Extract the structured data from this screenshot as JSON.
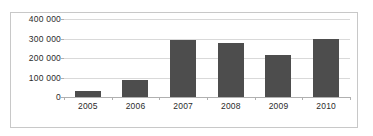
{
  "chart_data": {
    "type": "bar",
    "title": "",
    "subtitle": "",
    "xlabel": "",
    "ylabel": "",
    "categories": [
      "2005",
      "2006",
      "2007",
      "2008",
      "2009",
      "2010"
    ],
    "values": [
      30000,
      88000,
      292000,
      275000,
      218000,
      300000
    ],
    "series": [
      {
        "name": "",
        "values": [
          30000,
          88000,
          292000,
          275000,
          218000,
          300000
        ]
      }
    ],
    "ylim": [
      0,
      400000
    ],
    "ytick_values": [
      0,
      100000,
      200000,
      300000,
      400000
    ],
    "ytick_labels": [
      "0",
      "100 000",
      "200 000",
      "300 000",
      "400 000"
    ],
    "grid": true,
    "grid_axis": "y",
    "legend": false,
    "legend_position": "none",
    "bar_color": "#4d4d4d",
    "gridline_color": "#d9d9d9",
    "axis_color": "#b0b0b0",
    "border_color": "#c8c8c8",
    "background_color": "#ffffff",
    "text_color": "#2b2b2b"
  }
}
